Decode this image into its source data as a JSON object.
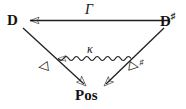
{
  "diagram": {
    "type": "commutative-triangle",
    "background_color": "#ffffff",
    "ink_color": "#1f1f1f",
    "nodes": [
      {
        "id": "d",
        "base": "D",
        "superscript": "",
        "label": "D",
        "position": "top-left"
      },
      {
        "id": "dsharp",
        "base": "D",
        "superscript": "♯",
        "label": "D♯",
        "position": "top-right"
      },
      {
        "id": "pos",
        "base": "Pos",
        "superscript": "",
        "label": "Pos",
        "position": "bottom-center"
      }
    ],
    "edges": [
      {
        "id": "gamma",
        "label": "Γ",
        "from": "dsharp",
        "to": "d",
        "style": "straight",
        "direction": "left",
        "label_position": "above-center"
      },
      {
        "id": "kappa",
        "label": "κ",
        "from": "right",
        "to": "left",
        "style": "squiggly",
        "direction": "left",
        "label_position": "above-center"
      },
      {
        "id": "tri-left",
        "label": "◁",
        "superscript": "",
        "from": "d",
        "to": "pos",
        "style": "straight",
        "direction": "down-right",
        "label_position": "left-of-edge"
      },
      {
        "id": "tri-right",
        "label": "▷",
        "superscript": "♯",
        "from": "dsharp",
        "to": "pos",
        "style": "straight",
        "direction": "down-left",
        "label_position": "right-of-edge"
      }
    ]
  }
}
